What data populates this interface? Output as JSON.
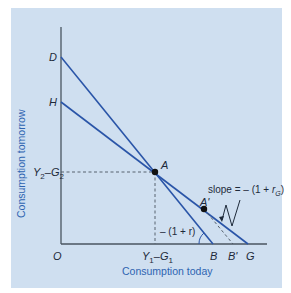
{
  "diagram": {
    "axes": {
      "x_title": "Consumption today",
      "y_title": "Consumption tomorrow",
      "origin_label": "O"
    },
    "points": {
      "D": "D",
      "H": "H",
      "A": "A",
      "A_prime": "A'",
      "B": "B",
      "B_prime": "B'",
      "G": "G"
    },
    "ticks": {
      "y_tick_main": "Y",
      "y_tick_sub1": "2",
      "y_tick_minus": "–G",
      "y_tick_sub2": "2",
      "x_tick_main": "Y",
      "x_tick_sub1": "1",
      "x_tick_minus": "–G",
      "x_tick_sub2": "1"
    },
    "annotations": {
      "slope_prefix": "slope = – (1 + ",
      "slope_r": "r",
      "slope_sub": "G",
      "slope_suffix": ")",
      "angle_label": "– (1 + r)"
    },
    "colors": {
      "background": "#cfdff0",
      "line": "#2a55a8",
      "axis": "#4a5560",
      "axis_title": "#2e64b0",
      "text": "#1e2a3a"
    }
  }
}
